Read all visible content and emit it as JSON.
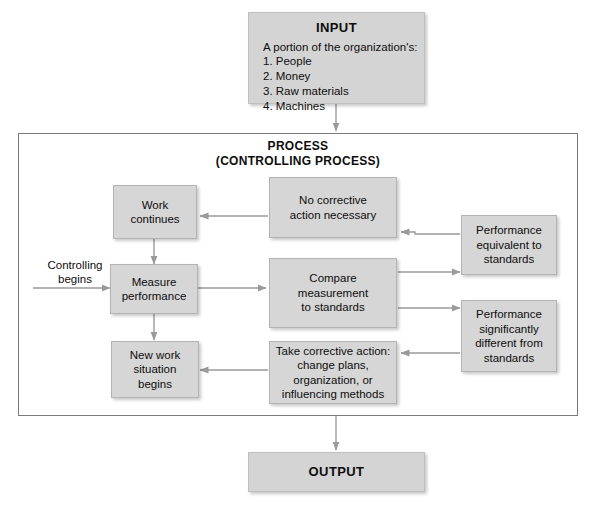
{
  "diagram": {
    "title_input": "INPUT",
    "input_lines": "A portion of the organization's:\n1. People\n2. Money\n3. Raw materials\n4. Machines",
    "process_title": "PROCESS\n(CONTROLLING PROCESS)",
    "entry_label": "Controlling\nbegins",
    "title_output": "OUTPUT",
    "nodes": {
      "work_continues": "Work\ncontinues",
      "measure_performance": "Measure\nperformance",
      "new_work_situation": "New work\nsituation\nbegins",
      "no_corrective_action": "No corrective\naction necessary",
      "compare_measurement": "Compare\nmeasurement\nto standards",
      "take_corrective_action": "Take corrective action:\nchange plans,\norganization, or\ninfluencing methods",
      "performance_equivalent": "Performance\nequivalent to\nstandards",
      "performance_different": "Performance\nsignificantly\ndifferent from\nstandards"
    },
    "colors": {
      "box_fill": "#d6d6d6",
      "box_border": "#b3b3b3",
      "frame_border": "#7a7a7a",
      "connector": "#9a9a9a",
      "text": "#0d0d0d",
      "background": "#ffffff"
    }
  }
}
